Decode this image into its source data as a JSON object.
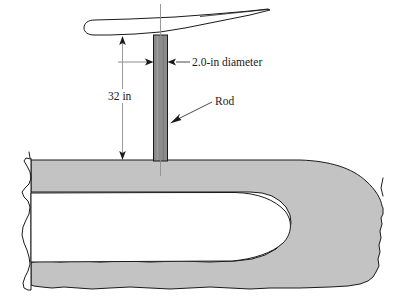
{
  "figure": {
    "background_color": "#ffffff",
    "width": 409,
    "height": 304
  },
  "colors": {
    "duct_fill": "#c3c3c3",
    "rod_fill": "#8a8a8a",
    "outline": "#1a1a1a",
    "centerline": "#888888",
    "text": "#1a1a1a"
  },
  "labels": {
    "diameter": "2.0-in diameter",
    "length": "32 in",
    "rod": "Rod"
  },
  "parts": {
    "vane_name": "vane-airfoil",
    "rod_name": "rod-body",
    "duct_name": "duct-wall-cutaway",
    "cavity_name": "duct-inner-cavity"
  },
  "dimensions": {
    "rod_diameter_value": "2.0",
    "rod_diameter_unit": "in",
    "rod_length_value": "32",
    "rod_length_unit": "in"
  },
  "annotations": [
    {
      "id": "diameter-callout",
      "text": "2.0-in diameter",
      "kind": "dimension",
      "style": "double-arrow-horizontal"
    },
    {
      "id": "length-callout",
      "text": "32 in",
      "kind": "dimension",
      "style": "double-arrow-vertical"
    },
    {
      "id": "rod-callout",
      "text": "Rod",
      "kind": "leader",
      "style": "single-arrow-leader"
    }
  ]
}
